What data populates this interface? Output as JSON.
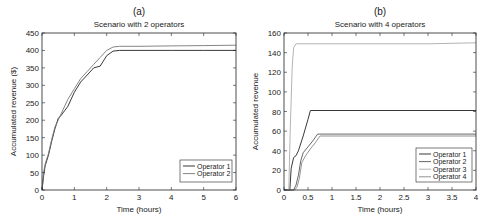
{
  "chart_data": [
    {
      "type": "line",
      "panel_label": "(a)",
      "title": "Scenario with 2 operators",
      "xlabel": "Time (hours)",
      "ylabel": "Accumulated revenue ($)",
      "xlim": [
        0,
        6
      ],
      "ylim": [
        0,
        450
      ],
      "xticks": [
        0,
        1,
        2,
        3,
        4,
        5,
        6
      ],
      "yticks": [
        0,
        50,
        100,
        150,
        200,
        250,
        300,
        350,
        400,
        450
      ],
      "grid": false,
      "legend_position": "lower right",
      "series": [
        {
          "name": "Operator 1",
          "color": "#222222",
          "x": [
            0,
            0.05,
            0.1,
            0.2,
            0.3,
            0.4,
            0.5,
            0.6,
            0.8,
            1.0,
            1.2,
            1.4,
            1.6,
            1.8,
            2.0,
            2.2,
            2.4,
            3,
            4,
            5,
            6
          ],
          "y": [
            0,
            40,
            70,
            100,
            140,
            175,
            205,
            215,
            240,
            280,
            310,
            330,
            350,
            355,
            385,
            398,
            400,
            400,
            400,
            400,
            400
          ]
        },
        {
          "name": "Operator 2",
          "color": "#777777",
          "x": [
            0,
            0.05,
            0.1,
            0.2,
            0.3,
            0.4,
            0.5,
            0.6,
            0.8,
            1.0,
            1.2,
            1.4,
            1.6,
            1.8,
            2.0,
            2.2,
            2.4,
            3,
            4,
            5,
            6
          ],
          "y": [
            0,
            50,
            75,
            105,
            145,
            180,
            200,
            220,
            260,
            290,
            320,
            340,
            360,
            380,
            400,
            410,
            412,
            412,
            413,
            414,
            415
          ]
        }
      ]
    },
    {
      "type": "line",
      "panel_label": "(b)",
      "title": "Scenario with 4 operators",
      "xlabel": "Time (hours)",
      "ylabel": "Accumulated revenue",
      "xlim": [
        0,
        4
      ],
      "ylim": [
        0,
        160
      ],
      "xticks": [
        0,
        0.5,
        1,
        1.5,
        2,
        2.5,
        3,
        3.5,
        4
      ],
      "yticks": [
        0,
        20,
        40,
        60,
        80,
        100,
        120,
        140,
        160
      ],
      "grid": false,
      "legend_position": "lower right",
      "series": [
        {
          "name": "Operator 1",
          "color": "#222222",
          "x": [
            0,
            0.12,
            0.15,
            0.2,
            0.25,
            0.3,
            0.4,
            0.5,
            0.55,
            1,
            2,
            3,
            4
          ],
          "y": [
            0,
            0,
            22,
            33,
            35,
            40,
            55,
            72,
            81,
            81,
            81,
            81,
            81
          ]
        },
        {
          "name": "Operator 2",
          "color": "#555555",
          "x": [
            0,
            0.2,
            0.25,
            0.3,
            0.35,
            0.4,
            0.5,
            0.6,
            0.7,
            1,
            2,
            3,
            4
          ],
          "y": [
            0,
            0,
            5,
            15,
            30,
            38,
            44,
            50,
            57,
            57,
            57,
            57,
            57
          ]
        },
        {
          "name": "Operator 3",
          "color": "#aaaaaa",
          "x": [
            0,
            0.1,
            0.13,
            0.17,
            0.2,
            0.25,
            0.3,
            1,
            2,
            3,
            4
          ],
          "y": [
            0,
            0,
            60,
            125,
            145,
            149,
            149,
            149,
            149,
            149,
            150
          ]
        },
        {
          "name": "Operator 4",
          "color": "#888888",
          "x": [
            0,
            0.22,
            0.27,
            0.32,
            0.37,
            0.45,
            0.55,
            0.65,
            0.75,
            1,
            2,
            3,
            4
          ],
          "y": [
            0,
            0,
            3,
            12,
            28,
            35,
            42,
            48,
            55,
            55,
            55,
            55,
            55
          ]
        }
      ]
    }
  ]
}
